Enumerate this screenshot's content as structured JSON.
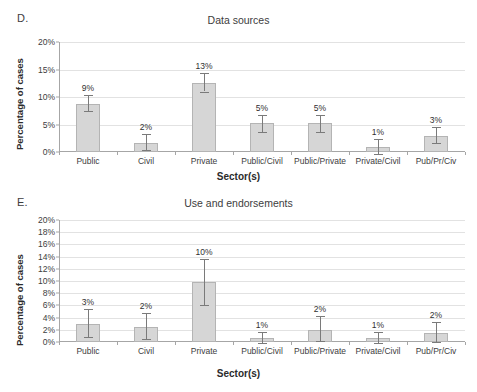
{
  "chart_data": [
    {
      "type": "bar",
      "panel_letter": "D.",
      "title": "Data sources",
      "xlabel": "Sector(s)",
      "ylabel": "Percentage of cases",
      "ylim": [
        0,
        20
      ],
      "ytick_step": 5,
      "ytick_labels": [
        "0%",
        "5%",
        "10%",
        "15%",
        "20%"
      ],
      "ytick_values": [
        0,
        5,
        10,
        15,
        20
      ],
      "grid": true,
      "legend": "none",
      "categories": [
        "Public",
        "Civil",
        "Private",
        "Public/Civil",
        "Public/Private",
        "Private/Civil",
        "Pub/Pr/Civ"
      ],
      "values": [
        8.8,
        1.7,
        12.5,
        5.2,
        5.2,
        1.0,
        3.0
      ],
      "data_labels": [
        "9%",
        "2%",
        "13%",
        "5%",
        "5%",
        "1%",
        "3%"
      ],
      "error_low": [
        7.4,
        0.4,
        11.0,
        3.7,
        3.7,
        -0.3,
        1.7
      ],
      "error_high": [
        10.3,
        3.2,
        14.4,
        6.7,
        6.7,
        2.3,
        4.5
      ]
    },
    {
      "type": "bar",
      "panel_letter": "E.",
      "title": "Use and endorsements",
      "xlabel": "Sector(s)",
      "ylabel": "Percentage of cases",
      "ylim": [
        0,
        20
      ],
      "ytick_step": 2,
      "ytick_labels": [
        "0%",
        "2%",
        "4%",
        "6%",
        "8%",
        "10%",
        "12%",
        "14%",
        "16%",
        "18%",
        "20%"
      ],
      "ytick_values": [
        0,
        2,
        4,
        6,
        8,
        10,
        12,
        14,
        16,
        18,
        20
      ],
      "grid": true,
      "legend": "none",
      "categories": [
        "Public",
        "Civil",
        "Private",
        "Public/Civil",
        "Public/Private",
        "Private/Civil",
        "Pub/Pr/Civ"
      ],
      "values": [
        2.9,
        2.5,
        9.9,
        0.6,
        2.0,
        0.6,
        1.5
      ],
      "data_labels": [
        "3%",
        "2%",
        "10%",
        "1%",
        "2%",
        "1%",
        "2%"
      ],
      "error_low": [
        0.8,
        0.5,
        6.0,
        -0.2,
        0.2,
        -0.2,
        0.0
      ],
      "error_high": [
        5.4,
        4.8,
        13.6,
        1.7,
        4.2,
        1.6,
        3.3
      ]
    }
  ]
}
